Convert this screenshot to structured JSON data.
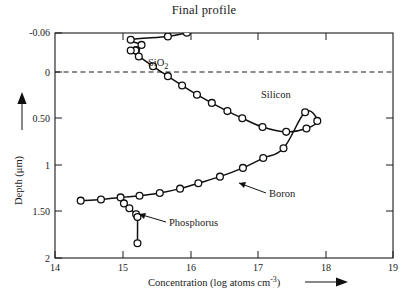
{
  "chart_data": {
    "type": "line",
    "title": "Final profile",
    "xlabel": "Concentration (log atoms cm",
    "xlabel_sup": "-3",
    "xlabel_tail": ")",
    "ylabel": "Depth (",
    "ylabel_unit": "μm",
    "ylabel_tail": ")",
    "xlim": [
      14,
      19
    ],
    "ylim": [
      -0.06,
      2
    ],
    "y_inverted": true,
    "grid": false,
    "legend_position": "inline-annotations",
    "xticks": [
      14,
      15,
      16,
      17,
      18,
      19
    ],
    "xtick_labels": [
      "14",
      "15",
      "16",
      "17",
      "18",
      "19"
    ],
    "yticks": [
      -0.06,
      0,
      0.5,
      1,
      1.5,
      2
    ],
    "ytick_labels": [
      "-0.06",
      "0",
      "0.50",
      "1",
      "1.50",
      "2"
    ],
    "reference_line": {
      "y": 0,
      "style": "dashed",
      "meaning": "oxide-silicon interface"
    },
    "annotations": [
      {
        "text": "SiO",
        "sub": "2",
        "x": 16.0,
        "y": 0.27,
        "leader": false
      },
      {
        "text": "Silicon",
        "x": 17.1,
        "y": 0.4,
        "leader": false
      },
      {
        "text": "Boron",
        "x": 17.0,
        "y": 1.34,
        "leader": true
      },
      {
        "text": "Phosphorus",
        "x": 16.05,
        "y": 1.67,
        "leader": true
      }
    ],
    "series": [
      {
        "name": "SiO2 profile (boron in oxide)",
        "marker": "open-circle",
        "points": [
          [
            15.95,
            -0.062
          ],
          [
            15.67,
            -0.029
          ],
          [
            15.12,
            0.002
          ],
          [
            15.28,
            0.049
          ],
          [
            15.2,
            0.095
          ],
          [
            15.19,
            0.101
          ]
        ]
      },
      {
        "name": "Boron",
        "marker": "open-circle",
        "points": [
          [
            15.12,
            0.1
          ],
          [
            15.24,
            0.155
          ],
          [
            15.45,
            0.245
          ],
          [
            15.67,
            0.335
          ],
          [
            15.88,
            0.42
          ],
          [
            16.1,
            0.505
          ],
          [
            16.32,
            0.58
          ],
          [
            16.55,
            0.655
          ],
          [
            16.77,
            0.72
          ],
          [
            17.07,
            0.8
          ],
          [
            17.42,
            0.845
          ],
          [
            17.72,
            0.815
          ],
          [
            17.88,
            0.745
          ],
          [
            17.7,
            0.665
          ],
          [
            17.38,
            0.995
          ],
          [
            17.08,
            1.085
          ],
          [
            16.78,
            1.175
          ],
          [
            16.44,
            1.255
          ],
          [
            16.12,
            1.315
          ],
          [
            15.85,
            1.365
          ],
          [
            15.55,
            1.405
          ],
          [
            15.25,
            1.43
          ],
          [
            14.97,
            1.445
          ],
          [
            14.68,
            1.465
          ],
          [
            14.38,
            1.475
          ]
        ]
      },
      {
        "name": "Phosphorus",
        "marker": "open-circle",
        "points": [
          [
            15.02,
            1.5
          ],
          [
            15.1,
            1.545
          ],
          [
            15.2,
            1.6
          ],
          [
            15.22,
            1.625
          ],
          [
            15.22,
            1.865
          ]
        ]
      }
    ]
  }
}
